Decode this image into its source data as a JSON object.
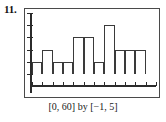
{
  "exercise": {
    "number": "11."
  },
  "figure": {
    "caption": "[0, 60] by [−1, 5]",
    "window": {
      "x_min": 0,
      "x_max": 60,
      "y_min": -1,
      "y_max": 5,
      "x_scale": 5,
      "y_scale": 1
    }
  },
  "chart_data": {
    "type": "bar",
    "title": "",
    "subtitle": "",
    "xlabel": "",
    "ylabel": "",
    "grid": false,
    "legend": null,
    "legend_position": "none",
    "axis_style": "calculator-window",
    "bin_width": 5,
    "bin_edges": [
      0,
      5,
      10,
      15,
      20,
      25,
      30,
      35,
      40,
      45,
      50,
      55,
      60
    ],
    "categories": [
      "0-5",
      "5-10",
      "10-15",
      "15-20",
      "20-25",
      "25-30",
      "30-35",
      "35-40",
      "40-45",
      "45-50",
      "50-55",
      "55-60"
    ],
    "values": [
      1,
      2,
      1,
      1,
      3,
      3,
      1,
      4,
      2,
      2,
      2,
      0
    ],
    "xlim": [
      0,
      60
    ],
    "ylim": [
      -1,
      5
    ],
    "xticks": [
      0,
      5,
      10,
      15,
      20,
      25,
      30,
      35,
      40,
      45,
      50,
      55,
      60
    ],
    "yticks": [
      0,
      1,
      2,
      3,
      4,
      5
    ],
    "annotations": []
  },
  "colors": {
    "ink": "#1a1a1a",
    "axis": "#2b2b2b",
    "bar_outline": "#3a3a3a",
    "bar_fill": "#ffffff",
    "frame": "#4a4a4a",
    "background": "#ffffff"
  }
}
